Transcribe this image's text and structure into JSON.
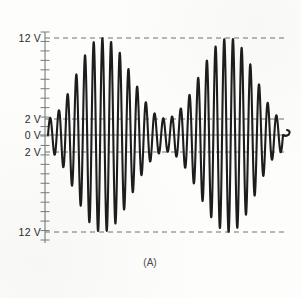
{
  "figure": {
    "caption": "(A)",
    "background_color": "#fdfdfb",
    "trace_color": "#1d1d1d",
    "axis_color": "#6f6f6f",
    "reference_line_color": "#707070"
  },
  "axis": {
    "y_labels": [
      {
        "text": "12 V",
        "value": 12,
        "y_px": 38
      },
      {
        "text": "2 V",
        "value": 2,
        "y_px": 119
      },
      {
        "text": "0 V",
        "value": 0,
        "y_px": 135
      },
      {
        "text": "2 V",
        "value": -2,
        "y_px": 152
      },
      {
        "text": "12 V",
        "value": -12,
        "y_px": 232
      }
    ],
    "tick_count": 22,
    "axis_x_px": 45,
    "axis_top_px": 32,
    "axis_bottom_px": 240
  },
  "chart_data": {
    "type": "line",
    "title": "",
    "subtitle": "",
    "xlabel": "",
    "ylabel": "",
    "caption": "(A)",
    "grid": false,
    "legend": "none",
    "ylim": [
      -13.5,
      13.5
    ],
    "xlim": [
      0,
      100
    ],
    "y_tick_labels": [
      "12 V",
      "2 V",
      "0 V",
      "2 V",
      "12 V"
    ],
    "y_tick_values": [
      12,
      2,
      0,
      -2,
      -12
    ],
    "reference_lines": [
      {
        "value": 12,
        "style": "dashed",
        "label": "12 V"
      },
      {
        "value": 2,
        "style": "dashed",
        "label": "2 V"
      },
      {
        "value": 0,
        "style": "solid",
        "label": "0 V"
      },
      {
        "value": -2,
        "style": "dashed",
        "label": "2 V"
      },
      {
        "value": -12,
        "style": "dashed",
        "label": "12 V"
      }
    ],
    "series": [
      {
        "name": "AM waveform",
        "carrier_cycles": 27,
        "modulation_cycles": 2,
        "carrier_amplitude_peak": 12,
        "carrier_amplitude_min": 2,
        "envelope_max": 12,
        "envelope_min": 2,
        "modulation_index": 0.714,
        "envelope_peaks_x": [
          28,
          72
        ],
        "envelope_troughs_x": [
          2,
          50,
          98
        ],
        "amplitude_envelope": [
          2.0,
          2.3,
          3.1,
          4.3,
          5.8,
          7.4,
          9.0,
          10.4,
          11.4,
          11.9,
          12.0,
          11.7,
          11.0,
          10.0,
          8.7,
          7.3,
          5.9,
          4.6,
          3.5,
          2.7,
          2.2,
          2.0,
          2.2,
          2.7,
          3.5,
          4.6,
          5.9,
          7.3,
          8.7,
          10.0,
          11.0,
          11.7,
          12.0,
          11.9,
          11.4,
          10.4,
          9.0,
          7.4,
          5.8,
          4.3,
          3.1,
          2.3,
          2.0
        ]
      }
    ]
  }
}
